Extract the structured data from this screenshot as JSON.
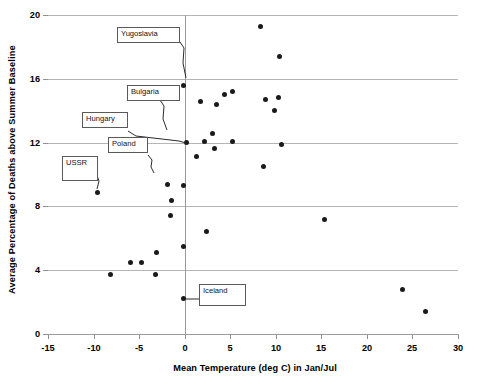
{
  "chart_data": {
    "type": "scatter",
    "title": "",
    "xlabel": "Mean Temperature (deg C) in Jan/Jul",
    "ylabel": "Average Percentage of Deaths above Summer Baseline",
    "xlim": [
      -15,
      30
    ],
    "ylim": [
      0,
      20
    ],
    "xticks": [
      -15,
      -10,
      -5,
      0,
      5,
      10,
      15,
      20,
      25,
      30
    ],
    "yticks": [
      0,
      4,
      8,
      12,
      16,
      20
    ],
    "grid": "horizontal",
    "legend": "none",
    "points": [
      {
        "x": -0.1,
        "y": 15.6,
        "label": "Yugoslavia"
      },
      {
        "x": 8.3,
        "y": 19.3,
        "label": ""
      },
      {
        "x": 10.4,
        "y": 17.4,
        "label": ""
      },
      {
        "x": 1.7,
        "y": 14.6,
        "label": "Bulgaria"
      },
      {
        "x": 4.4,
        "y": 15.0,
        "label": ""
      },
      {
        "x": 5.2,
        "y": 15.2,
        "label": ""
      },
      {
        "x": 3.5,
        "y": 14.4,
        "label": ""
      },
      {
        "x": 8.9,
        "y": 14.7,
        "label": ""
      },
      {
        "x": 10.3,
        "y": 14.8,
        "label": ""
      },
      {
        "x": 9.9,
        "y": 14.0,
        "label": ""
      },
      {
        "x": 0.2,
        "y": 12.0,
        "label": "Hungary"
      },
      {
        "x": 3.1,
        "y": 12.6,
        "label": ""
      },
      {
        "x": 2.2,
        "y": 12.1,
        "label": ""
      },
      {
        "x": 5.2,
        "y": 12.1,
        "label": ""
      },
      {
        "x": 3.3,
        "y": 11.6,
        "label": ""
      },
      {
        "x": 1.3,
        "y": 11.1,
        "label": "Poland"
      },
      {
        "x": 10.6,
        "y": 11.9,
        "label": ""
      },
      {
        "x": 8.7,
        "y": 10.5,
        "label": ""
      },
      {
        "x": -9.6,
        "y": 8.9,
        "label": "USSR"
      },
      {
        "x": -1.9,
        "y": 9.4,
        "label": ""
      },
      {
        "x": -0.1,
        "y": 9.3,
        "label": ""
      },
      {
        "x": -1.5,
        "y": 8.4,
        "label": ""
      },
      {
        "x": -1.6,
        "y": 7.4,
        "label": ""
      },
      {
        "x": 15.4,
        "y": 7.2,
        "label": ""
      },
      {
        "x": 2.4,
        "y": 6.4,
        "label": ""
      },
      {
        "x": -0.1,
        "y": 5.5,
        "label": ""
      },
      {
        "x": -3.1,
        "y": 5.1,
        "label": ""
      },
      {
        "x": -6.0,
        "y": 4.5,
        "label": ""
      },
      {
        "x": -4.7,
        "y": 4.5,
        "label": ""
      },
      {
        "x": -8.1,
        "y": 3.7,
        "label": ""
      },
      {
        "x": -3.2,
        "y": 3.7,
        "label": ""
      },
      {
        "x": 23.9,
        "y": 2.8,
        "label": ""
      },
      {
        "x": 26.4,
        "y": 1.4,
        "label": ""
      },
      {
        "x": -0.1,
        "y": 2.2,
        "label": "Iceland"
      }
    ],
    "callouts": [
      {
        "name": "Yugoslavia",
        "text": "Yugoslavia"
      },
      {
        "name": "Bulgaria",
        "text": "Bulgaria"
      },
      {
        "name": "Hungary",
        "text": "Hungary"
      },
      {
        "name": "Poland",
        "text": "Poland"
      },
      {
        "name": "USSR",
        "text": "USSR"
      },
      {
        "name": "Iceland",
        "text": "Iceland"
      }
    ],
    "colors": {
      "marker": "#1a1a1a",
      "grid": "#b5b5b5",
      "axis": "#9a9a9a",
      "callout_border": "#5a5a5a",
      "background": "#ffffff"
    }
  }
}
